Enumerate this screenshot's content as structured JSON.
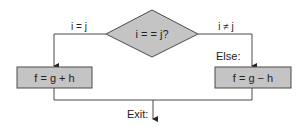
{
  "diagram": {
    "type": "flowchart",
    "decision": {
      "label": "i = = j?"
    },
    "branches": {
      "true_label": "i = j",
      "false_label": "i ≠ j"
    },
    "then_box": {
      "label": "f = g + h"
    },
    "else_label": "Else:",
    "else_box": {
      "label": "f = g − h"
    },
    "exit_label": "Exit:",
    "colors": {
      "shape_fill": "#c4c4c4",
      "stroke": "#4a4a4a",
      "text": "#222222"
    }
  }
}
